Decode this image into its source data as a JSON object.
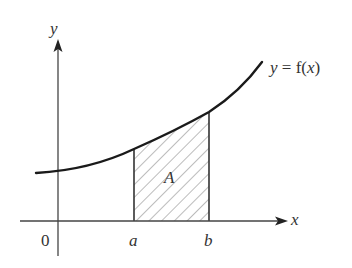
{
  "diagram": {
    "axes": {
      "x_label": "x",
      "y_label": "y",
      "origin_label": "0"
    },
    "curve": {
      "label": "y = f(x)",
      "label_parts": [
        "y",
        " = f(",
        "x",
        ")"
      ]
    },
    "bounds": {
      "a_label": "a",
      "b_label": "b"
    },
    "region": {
      "label": "A",
      "fill": "hatched"
    },
    "colors": {
      "curve": "#1a1a1a",
      "axes": "#444444",
      "hatch": "#777777",
      "text": "#333333"
    }
  }
}
